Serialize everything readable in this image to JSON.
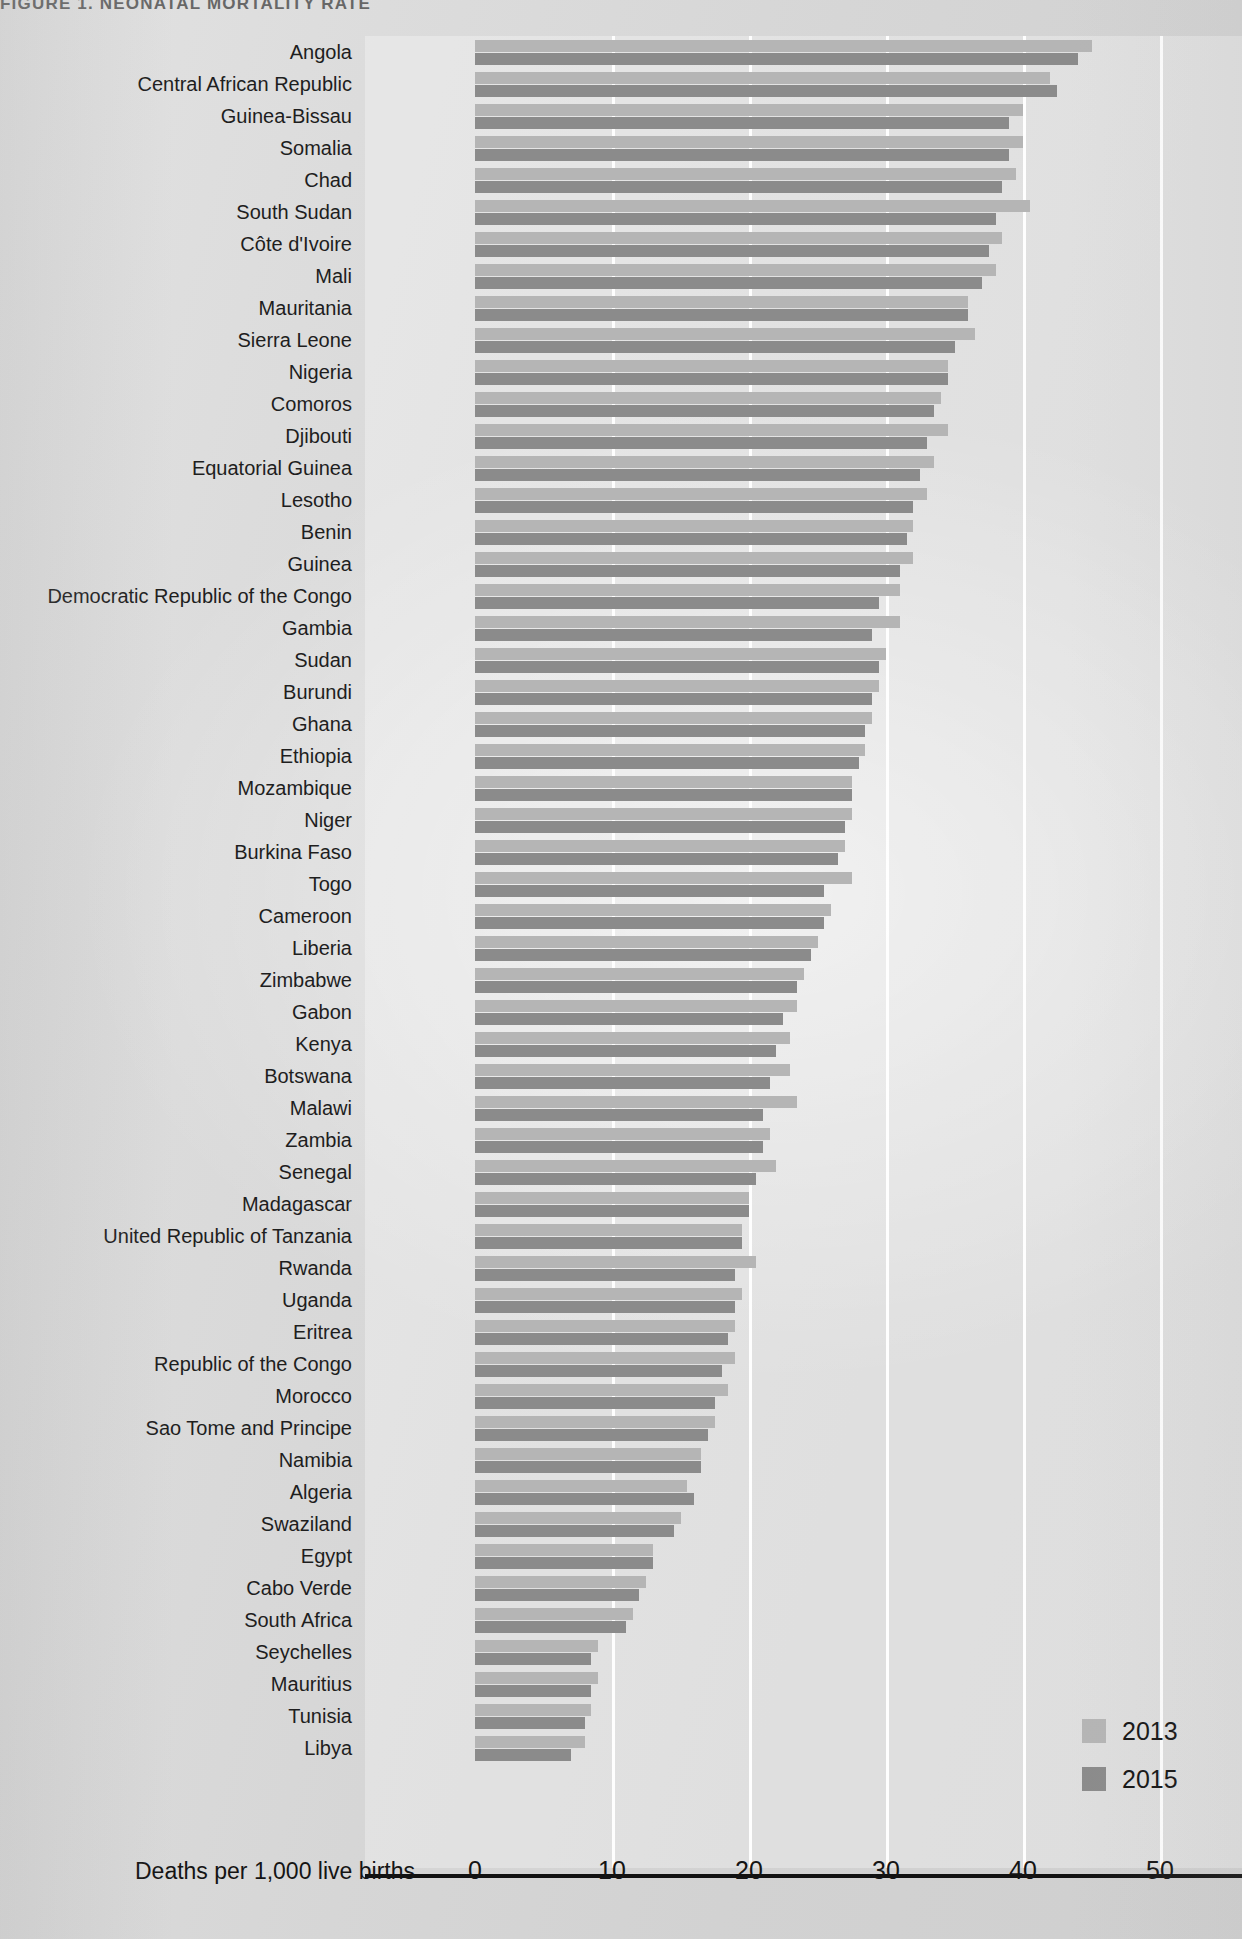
{
  "figure": {
    "title": "FIGURE 1. NEONATAL MORTALITY RATE",
    "axis_label": "Deaths per 1,000 live births"
  },
  "legend": {
    "items": [
      {
        "label": "2013",
        "color": "#b5b5b5"
      },
      {
        "label": "2015",
        "color": "#8b8b8b"
      }
    ]
  },
  "chart_data": {
    "type": "bar",
    "orientation": "horizontal",
    "title": "FIGURE 1. NEONATAL MORTALITY RATE",
    "xlabel": "Deaths per 1,000 live births",
    "ylabel": "",
    "xlim": [
      0,
      53
    ],
    "xticks": [
      0,
      10,
      20,
      30,
      40,
      50
    ],
    "grid": "vertical",
    "legend_position": "bottom-right",
    "categories": [
      "Angola",
      "Central African Republic",
      "Guinea-Bissau",
      "Somalia",
      "Chad",
      "South Sudan",
      "Côte d'Ivoire",
      "Mali",
      "Mauritania",
      "Sierra Leone",
      "Nigeria",
      "Comoros",
      "Djibouti",
      "Equatorial Guinea",
      "Lesotho",
      "Benin",
      "Guinea",
      "Democratic Republic of the Congo",
      "Gambia",
      "Sudan",
      "Burundi",
      "Ghana",
      "Ethiopia",
      "Mozambique",
      "Niger",
      "Burkina Faso",
      "Togo",
      "Cameroon",
      "Liberia",
      "Zimbabwe",
      "Gabon",
      "Kenya",
      "Botswana",
      "Malawi",
      "Zambia",
      "Senegal",
      "Madagascar",
      "United Republic of Tanzania",
      "Rwanda",
      "Uganda",
      "Eritrea",
      "Republic of the Congo",
      "Morocco",
      "Sao Tome and Principe",
      "Namibia",
      "Algeria",
      "Swaziland",
      "Egypt",
      "Cabo Verde",
      "South Africa",
      "Seychelles",
      "Mauritius",
      "Tunisia",
      "Libya"
    ],
    "series": [
      {
        "name": "2013",
        "color": "#b5b5b5",
        "values": [
          45.0,
          42.0,
          40.0,
          40.0,
          39.5,
          40.5,
          38.5,
          38.0,
          36.0,
          36.5,
          34.5,
          34.0,
          34.5,
          33.5,
          33.0,
          32.0,
          32.0,
          31.0,
          31.0,
          30.0,
          29.5,
          29.0,
          28.5,
          27.5,
          27.5,
          27.0,
          27.5,
          26.0,
          25.0,
          24.0,
          23.5,
          23.0,
          23.0,
          23.5,
          21.5,
          22.0,
          20.0,
          19.5,
          20.5,
          19.5,
          19.0,
          19.0,
          18.5,
          17.5,
          16.5,
          15.5,
          15.0,
          13.0,
          12.5,
          11.5,
          9.0,
          9.0,
          8.5,
          8.0
        ]
      },
      {
        "name": "2015",
        "color": "#8b8b8b",
        "values": [
          44.0,
          42.5,
          39.0,
          39.0,
          38.5,
          38.0,
          37.5,
          37.0,
          36.0,
          35.0,
          34.5,
          33.5,
          33.0,
          32.5,
          32.0,
          31.5,
          31.0,
          29.5,
          29.0,
          29.5,
          29.0,
          28.5,
          28.0,
          27.5,
          27.0,
          26.5,
          25.5,
          25.5,
          24.5,
          23.5,
          22.5,
          22.0,
          21.5,
          21.0,
          21.0,
          20.5,
          20.0,
          19.5,
          19.0,
          19.0,
          18.5,
          18.0,
          17.5,
          17.0,
          16.5,
          16.0,
          14.5,
          13.0,
          12.0,
          11.0,
          8.5,
          8.5,
          8.0,
          7.0
        ]
      }
    ]
  }
}
